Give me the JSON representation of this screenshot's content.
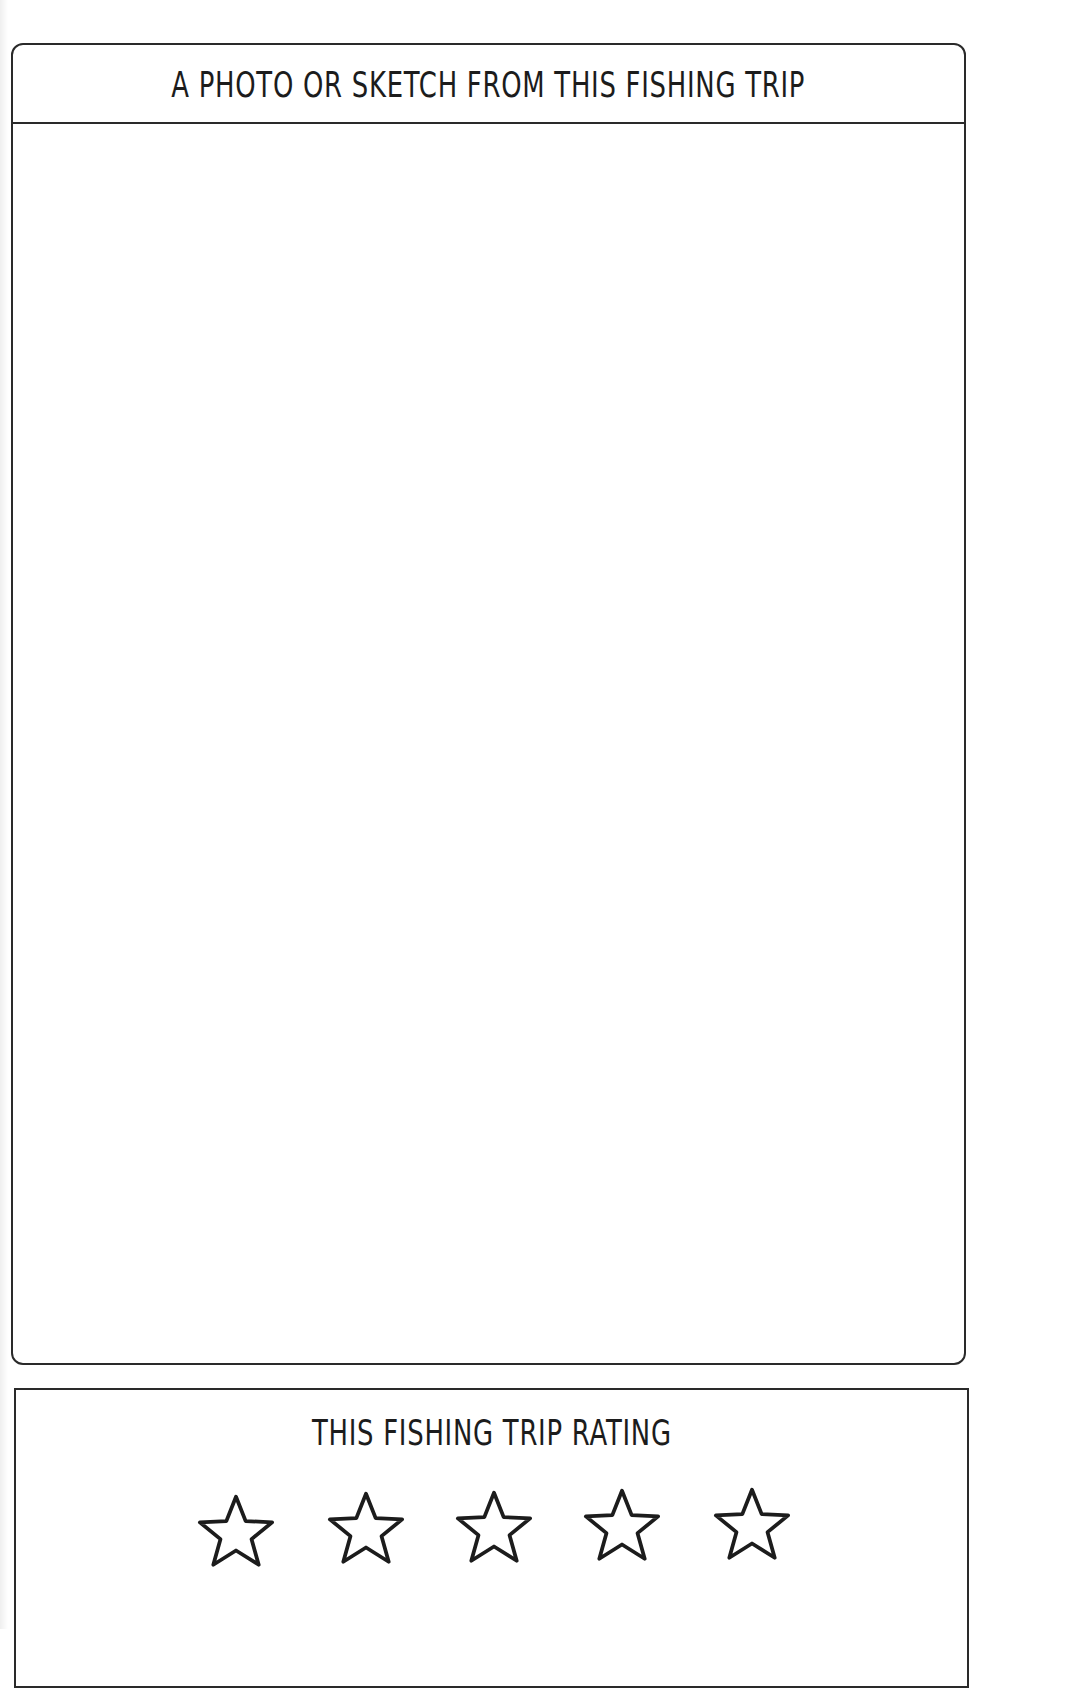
{
  "page": {
    "type": "fishing-journal-page"
  },
  "photo_section": {
    "title": "A PHOTO OR SKETCH FROM THIS FISHING TRIP",
    "content": ""
  },
  "rating_section": {
    "title": "THIS FISHING TRIP RATING",
    "max_stars": 5,
    "filled_stars": 0,
    "stars": [
      {
        "index": 1,
        "icon": "star-outline-icon",
        "filled": false
      },
      {
        "index": 2,
        "icon": "star-outline-icon",
        "filled": false
      },
      {
        "index": 3,
        "icon": "star-outline-icon",
        "filled": false
      },
      {
        "index": 4,
        "icon": "star-outline-icon",
        "filled": false
      },
      {
        "index": 5,
        "icon": "star-outline-icon",
        "filled": false
      }
    ]
  },
  "colors": {
    "ink": "#1c1c1c",
    "border": "#2a2a2a",
    "paper": "#ffffff"
  }
}
